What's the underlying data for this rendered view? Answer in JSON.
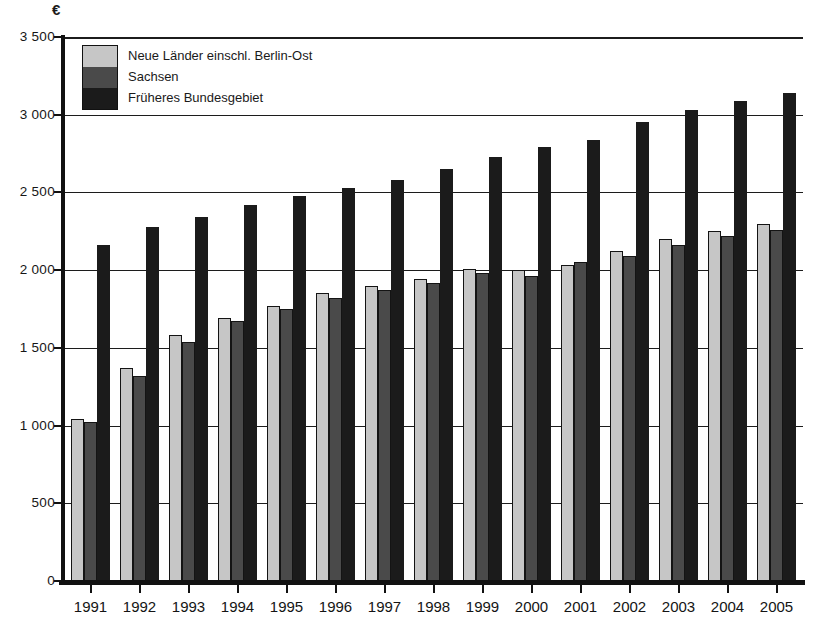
{
  "chart_data": {
    "type": "bar",
    "title": "",
    "xlabel": "",
    "ylabel": "€",
    "categories": [
      "1991",
      "1992",
      "1993",
      "1994",
      "1995",
      "1996",
      "1997",
      "1998",
      "1999",
      "2000",
      "2001",
      "2002",
      "2003",
      "2004",
      "2005"
    ],
    "series": [
      {
        "name": "Neue Länder einschl. Berlin-Ost",
        "color": "#c6c6c6",
        "values": [
          1040,
          1370,
          1580,
          1690,
          1770,
          1850,
          1900,
          1940,
          2010,
          2000,
          2030,
          2120,
          2200,
          2250,
          2300
        ]
      },
      {
        "name": "Sachsen",
        "color": "#4a4a4a",
        "values": [
          1020,
          1320,
          1540,
          1670,
          1750,
          1820,
          1870,
          1920,
          1980,
          1960,
          2050,
          2090,
          2160,
          2220,
          2260
        ]
      },
      {
        "name": "Früheres Bundesgebiet",
        "color": "#1b1b1b",
        "values": [
          2160,
          2280,
          2340,
          2420,
          2480,
          2530,
          2580,
          2650,
          2730,
          2790,
          2840,
          2950,
          3030,
          3090,
          3140
        ]
      }
    ],
    "ylim": [
      0,
      3500
    ],
    "ytick_interval": 500,
    "ytick_labels": [
      "0",
      "500",
      "1 000",
      "1 500",
      "2 000",
      "2 500",
      "3 000",
      "3 500"
    ],
    "grid": true,
    "legend_position": "top-left"
  }
}
